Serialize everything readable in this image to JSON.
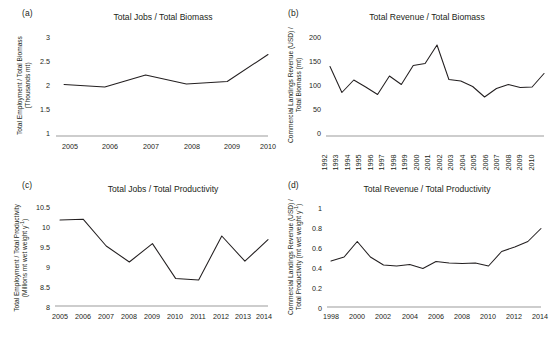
{
  "figure": {
    "panels": [
      "a",
      "b",
      "c",
      "d"
    ]
  },
  "panel_a": {
    "letter": "(a)",
    "title": "Total Jobs / Total Biomass",
    "ylabel_line1": "Total Employment / Total Biomass",
    "ylabel_line2": "(Thousands mt)",
    "yticks": [
      "3",
      "2.5",
      "2",
      "1.5",
      "1"
    ],
    "xticks": [
      "2005",
      "2006",
      "2007",
      "2008",
      "2009",
      "2010"
    ]
  },
  "panel_b": {
    "letter": "(b)",
    "title": "Total Revenue / Total Biomass",
    "ylabel_line1": "Commercial Landings Revenue (USD) /",
    "ylabel_line2": "Total Biomass (mt)",
    "yticks": [
      "200",
      "150",
      "100",
      "50",
      "0"
    ],
    "xticks": [
      "1992",
      "1993",
      "1994",
      "1995",
      "1996",
      "1997",
      "1998",
      "1999",
      "2000",
      "2001",
      "2002",
      "2003",
      "2004",
      "2005",
      "2006",
      "2007",
      "2008",
      "2009",
      "2010"
    ]
  },
  "panel_c": {
    "letter": "(c)",
    "title": "Total Jobs / Total Productivity",
    "ylabel_line1": "Total Employment / Total Productivity",
    "ylabel_line2": "(Millions mt wet weight y",
    "ylabel_line2_sup": "-1",
    "ylabel_line2_end": ")",
    "yticks": [
      "10.5",
      "10",
      "9.5",
      "9",
      "8.5",
      "8"
    ],
    "xticks": [
      "2005",
      "2006",
      "2007",
      "2008",
      "2009",
      "2010",
      "2011",
      "2012",
      "2013",
      "2014"
    ]
  },
  "panel_d": {
    "letter": "(d)",
    "title": "Total Revenue / Total Productivity",
    "ylabel_line1": "Commercial Landings Revenue (USD) /",
    "ylabel_line2": "Total Productivity (mt wet weight y",
    "ylabel_line2_sup": "-1",
    "ylabel_line2_end": ")",
    "yticks": [
      "1",
      "0.8",
      "0.6",
      "0.4",
      "0.2",
      "0"
    ],
    "xticks": [
      "1998",
      "2000",
      "2002",
      "2004",
      "2006",
      "2008",
      "2010",
      "2012",
      "2014"
    ]
  },
  "chart_data": [
    {
      "id": "panel_a",
      "type": "line",
      "title": "Total Jobs / Total Biomass",
      "xlabel": "",
      "ylabel": "Total Employment / Total Biomass (Thousands mt)",
      "x": [
        2005,
        2006,
        2007,
        2008,
        2009,
        2010
      ],
      "values": [
        2.03,
        1.98,
        2.22,
        2.04,
        2.09,
        2.63
      ],
      "ylim": [
        1,
        3
      ],
      "ytick_values": [
        1,
        1.5,
        2,
        2.5,
        3
      ],
      "grid": false,
      "legend": "none",
      "line_color": "#231f20"
    },
    {
      "id": "panel_b",
      "type": "line",
      "title": "Total Revenue / Total Biomass",
      "xlabel": "",
      "ylabel": "Commercial Landings Revenue (USD) / Total Biomass (mt)",
      "x": [
        1992,
        1993,
        1994,
        1995,
        1996,
        1997,
        1998,
        1999,
        2000,
        2001,
        2002,
        2003,
        2004,
        2005,
        2006,
        2007,
        2008,
        2009,
        2010
      ],
      "values": [
        139,
        87,
        112,
        98,
        83,
        120,
        103,
        141,
        145,
        182,
        113,
        110,
        99,
        78,
        95,
        103,
        97,
        98,
        125
      ],
      "ylim": [
        0,
        200
      ],
      "ytick_values": [
        0,
        50,
        100,
        150,
        200
      ],
      "grid": false,
      "legend": "none",
      "line_color": "#231f20"
    },
    {
      "id": "panel_c",
      "type": "line",
      "title": "Total Jobs / Total Productivity",
      "xlabel": "",
      "ylabel": "Total Employment / Total Productivity (Millions mt wet weight y-1)",
      "x": [
        2005,
        2006,
        2007,
        2008,
        2009,
        2010,
        2011,
        2012,
        2013,
        2014
      ],
      "values": [
        10.15,
        10.17,
        9.5,
        9.1,
        9.56,
        8.69,
        8.65,
        9.75,
        9.12,
        9.66
      ],
      "ylim": [
        8,
        10.5
      ],
      "ytick_values": [
        8,
        8.5,
        9,
        9.5,
        10,
        10.5
      ],
      "grid": false,
      "legend": "none",
      "line_color": "#231f20"
    },
    {
      "id": "panel_d",
      "type": "line",
      "title": "Total Revenue / Total Productivity",
      "xlabel": "",
      "ylabel": "Commercial Landings Revenue (USD) / Total Productivity (mt wet weight y-1)",
      "x": [
        1998,
        1999,
        2000,
        2001,
        2002,
        2003,
        2004,
        2005,
        2006,
        2007,
        2008,
        2009,
        2010,
        2011,
        2012,
        2013,
        2014
      ],
      "values": [
        0.46,
        0.5,
        0.655,
        0.5,
        0.42,
        0.41,
        0.425,
        0.385,
        0.455,
        0.44,
        0.435,
        0.44,
        0.41,
        0.555,
        0.6,
        0.655,
        0.785
      ],
      "ylim": [
        0,
        1
      ],
      "ytick_values": [
        0,
        0.2,
        0.4,
        0.6,
        0.8,
        1
      ],
      "grid": false,
      "legend": "none",
      "line_color": "#231f20"
    }
  ]
}
